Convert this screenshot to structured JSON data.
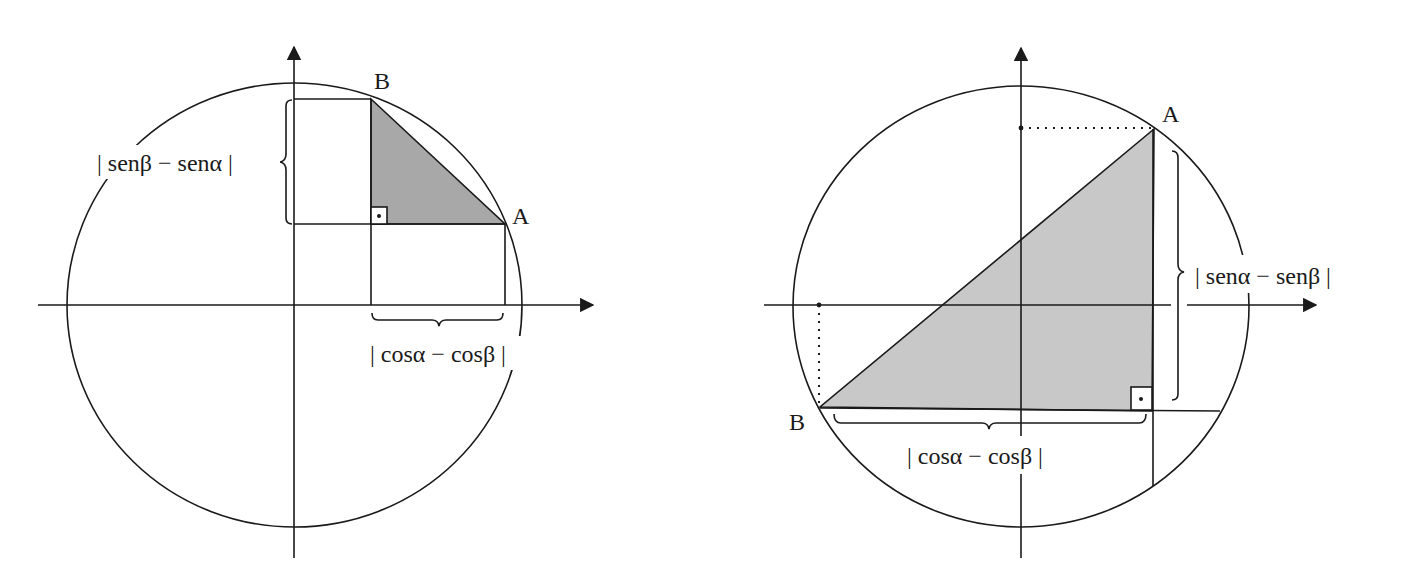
{
  "figures": [
    {
      "id": "left",
      "point_labels": {
        "A": "A",
        "B": "B"
      },
      "vertical_label": "| senβ − senα |",
      "horizontal_label": "| cosα − cosβ |",
      "shade_color": "#a8a8a8"
    },
    {
      "id": "right",
      "point_labels": {
        "A": "A",
        "B": "B"
      },
      "vertical_label": "| senα − senβ |",
      "horizontal_label": "| cosα − cosβ |",
      "shade_color": "#c8c8c8"
    }
  ],
  "colors": {
    "stroke": "#1a1a1a",
    "background": "#ffffff"
  }
}
